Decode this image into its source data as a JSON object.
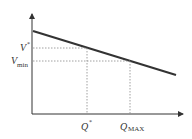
{
  "diagram": {
    "type": "line-with-reference-points",
    "axes": {
      "x_axis": {
        "label": ""
      },
      "y_axis": {
        "label": ""
      }
    },
    "line": {
      "description": "downward sloping straight line",
      "color": "#333333"
    },
    "y_markers": [
      {
        "id": "v_star",
        "base": "V",
        "sup": "*",
        "label": "V*"
      },
      {
        "id": "v_min",
        "base": "V",
        "sub": "min",
        "label": "Vmin"
      }
    ],
    "x_markers": [
      {
        "id": "q_star",
        "base": "Q",
        "sup": "*",
        "label": "Q*"
      },
      {
        "id": "q_max",
        "base": "Q",
        "sub": "MAX",
        "label": "QMAX"
      }
    ],
    "colors": {
      "axis": "#333333",
      "guide": "#888888",
      "background": "#ffffff"
    }
  }
}
